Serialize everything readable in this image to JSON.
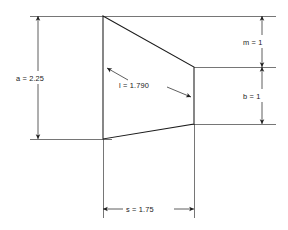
{
  "diagram": {
    "background_color": "#ffffff",
    "line_color": "#1c1c1c",
    "extension_line_color": "#3c3c3c",
    "text_color": "#1a1a1a"
  },
  "shape": {
    "name": "trapezoid",
    "vertices": [
      {
        "x": 103,
        "y": 16
      },
      {
        "x": 194,
        "y": 67
      },
      {
        "x": 194,
        "y": 124
      },
      {
        "x": 103,
        "y": 139
      }
    ]
  },
  "dimensions": {
    "root_height": {
      "symbol": "a",
      "value": "2.25",
      "label": "a = 2.25",
      "orientation": "vertical",
      "position": "left"
    },
    "mean_chord": {
      "symbol": "l",
      "value": "1.790",
      "label": "l = 1.790",
      "orientation": "diagonal",
      "position": "interior"
    },
    "upper_offset": {
      "symbol": "m",
      "value": "1",
      "label": "m = 1",
      "orientation": "vertical",
      "position": "right-upper"
    },
    "tip_height": {
      "symbol": "b",
      "value": "1",
      "label": "b = 1",
      "orientation": "vertical",
      "position": "right-lower"
    },
    "span": {
      "symbol": "s",
      "value": "1.75",
      "label": "s = 1.75",
      "orientation": "horizontal",
      "position": "bottom"
    }
  }
}
